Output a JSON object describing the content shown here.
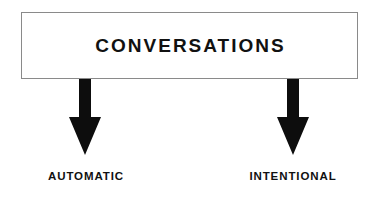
{
  "diagram": {
    "title": "CONVERSATIONS",
    "root": {
      "label": "CONVERSATIONS",
      "shape": "rectangle",
      "fill_color": "#ffffff",
      "border_color": "#8a8a8a",
      "text_color": "#111111"
    },
    "connectors": [
      {
        "name": "arrow-left",
        "type": "block-arrow",
        "direction": "down",
        "color": "#0d0d0d",
        "from": "CONVERSATIONS",
        "to": "AUTOMATIC"
      },
      {
        "name": "arrow-right",
        "type": "block-arrow",
        "direction": "down",
        "color": "#0d0d0d",
        "from": "CONVERSATIONS",
        "to": "INTENTIONAL"
      }
    ],
    "branches": [
      {
        "label": "AUTOMATIC",
        "text_color": "#111111"
      },
      {
        "label": "INTENTIONAL",
        "text_color": "#111111"
      }
    ],
    "background_color": "#ffffff"
  }
}
